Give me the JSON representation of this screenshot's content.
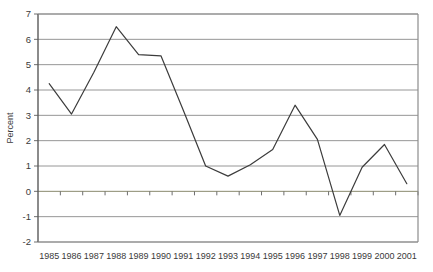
{
  "chart_data": {
    "type": "line",
    "title": "",
    "subtitle": "",
    "xlabel": "",
    "ylabel": "Percent",
    "categories": [
      "1985",
      "1986",
      "1987",
      "1988",
      "1989",
      "1990",
      "1991",
      "1992",
      "1993",
      "1994",
      "1995",
      "1996",
      "1997",
      "1998",
      "1999",
      "2000",
      "2001"
    ],
    "values": [
      4.25,
      3.05,
      4.7,
      6.5,
      5.4,
      5.35,
      3.2,
      1.0,
      0.6,
      1.05,
      1.65,
      3.4,
      2.05,
      -0.95,
      0.95,
      1.85,
      0.3
    ],
    "series": [
      {
        "name": "Percent",
        "values": [
          4.25,
          3.05,
          4.7,
          6.5,
          5.4,
          5.35,
          3.2,
          1.0,
          0.6,
          1.05,
          1.65,
          3.4,
          2.05,
          -0.95,
          0.95,
          1.85,
          0.3
        ]
      }
    ],
    "ylim": [
      -2,
      7
    ],
    "ytick_labels": [
      "7",
      "6",
      "5",
      "4",
      "3",
      "2",
      "1",
      "0",
      "-1",
      "-2"
    ],
    "ytick_values": [
      7,
      6,
      5,
      4,
      3,
      2,
      1,
      0,
      -1,
      -2
    ],
    "grid": true,
    "grid_axis": "y",
    "legend": false,
    "legend_position": "none",
    "annotations": [],
    "colors": {
      "line": "#3c3c3c",
      "gridline": "#969696",
      "zero_line": "#8a8a6e",
      "axis": "#6e6e6e",
      "plot_background": "#ffffff",
      "text": "#3a3a3a"
    }
  }
}
